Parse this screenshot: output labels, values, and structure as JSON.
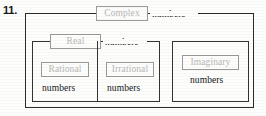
{
  "exercise": {
    "number": "11."
  },
  "diagram": {
    "type": "nested-set-venn",
    "sets": [
      {
        "id": "complex",
        "label": "Complex",
        "word": "numbers",
        "level": 0,
        "contains": [
          "real",
          "imaginary"
        ]
      },
      {
        "id": "real",
        "label": "Real",
        "word": "numbers",
        "level": 1,
        "contains": [
          "rational",
          "irrational"
        ]
      },
      {
        "id": "rational",
        "label": "Rational",
        "word": "numbers",
        "level": 2,
        "contains": []
      },
      {
        "id": "irrational",
        "label": "Irrational",
        "word": "numbers",
        "level": 2,
        "contains": []
      },
      {
        "id": "imaginary",
        "label": "Imaginary",
        "word": "numbers",
        "level": 1,
        "contains": []
      }
    ]
  },
  "colors": {
    "page_background": "#fdfdfc",
    "box_border": "#2a2a2a",
    "chip_border": "#9a9a9a",
    "chip_text": "#b8b8b8",
    "word_text": "#161616"
  }
}
